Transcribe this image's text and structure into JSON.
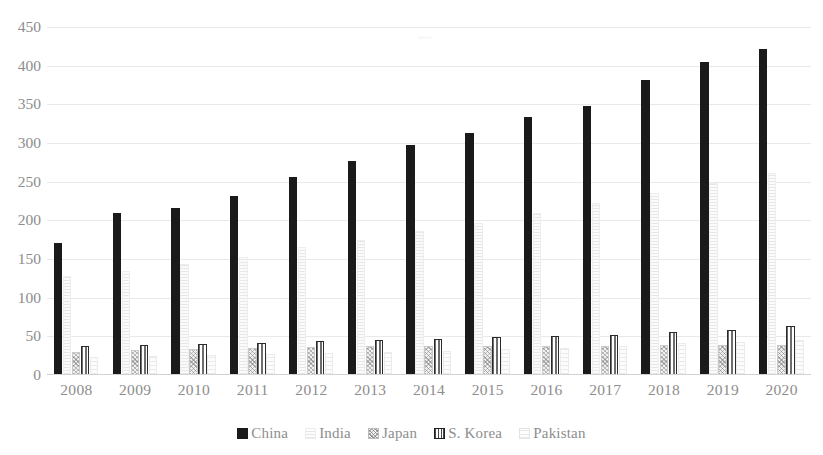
{
  "chart_data": {
    "type": "bar",
    "title": "",
    "subtitle": "",
    "xlabel": "",
    "ylabel": "",
    "categories": [
      "2008",
      "2009",
      "2010",
      "2011",
      "2012",
      "2013",
      "2014",
      "2015",
      "2016",
      "2017",
      "2018",
      "2019",
      "2020"
    ],
    "ylim": [
      0,
      450
    ],
    "ytick_labels": [
      "0",
      "50",
      "100",
      "150",
      "200",
      "250",
      "300",
      "350",
      "400",
      "450"
    ],
    "ytick_values": [
      0,
      50,
      100,
      150,
      200,
      250,
      300,
      350,
      400,
      450
    ],
    "grid": true,
    "grid_axis": "y",
    "legend_position": "bottom",
    "series": [
      {
        "name": "China",
        "color": "#1a1a1a",
        "pattern": "solid",
        "values": [
          171,
          210,
          216,
          231,
          256,
          277,
          297,
          313,
          333,
          348,
          381,
          405,
          422
        ]
      },
      {
        "name": "India",
        "color": "#fbfbfb",
        "pattern": "light-horizontal",
        "values": [
          128,
          135,
          143,
          152,
          166,
          175,
          186,
          196,
          210,
          222,
          236,
          248,
          261
        ]
      },
      {
        "name": "Japan",
        "color": "#f0f0f0",
        "pattern": "cross-hatch",
        "values": [
          30,
          32,
          33,
          35,
          36,
          37,
          38,
          38,
          38,
          38,
          39,
          39,
          39
        ]
      },
      {
        "name": "S. Korea",
        "color": "#ffffff",
        "pattern": "vertical-stripe",
        "values": [
          37,
          39,
          40,
          42,
          44,
          45,
          47,
          49,
          51,
          52,
          55,
          58,
          63
        ]
      },
      {
        "name": "Pakistan",
        "color": "#fcfcfc",
        "pattern": "light-dotted",
        "values": [
          23,
          25,
          26,
          27,
          29,
          30,
          31,
          33,
          35,
          38,
          41,
          43,
          45
        ]
      }
    ]
  }
}
